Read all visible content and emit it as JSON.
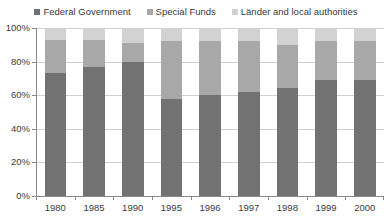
{
  "chart_data": {
    "type": "bar",
    "subtype": "stacked-100-percent",
    "title": "",
    "xlabel": "",
    "ylabel": "",
    "ylim": [
      0,
      100
    ],
    "ytick_labels": [
      "0%",
      "20%",
      "40%",
      "60%",
      "80%",
      "100%"
    ],
    "ytick_values": [
      0,
      20,
      40,
      60,
      80,
      100
    ],
    "grid": true,
    "legend_position": "top",
    "categories": [
      "1980",
      "1985",
      "1990",
      "1995",
      "1996",
      "1997",
      "1998",
      "1999",
      "2000"
    ],
    "series": [
      {
        "name": "Federal Government",
        "color": "#727272",
        "values": [
          73,
          77,
          80,
          58,
          60,
          62,
          64,
          69,
          69
        ]
      },
      {
        "name": "Special Funds",
        "color": "#a8a8a8",
        "values": [
          20,
          16,
          11,
          34,
          32,
          30,
          26,
          23,
          23
        ]
      },
      {
        "name": "Länder and local authorities",
        "color": "#d2d2d2",
        "values": [
          7,
          7,
          9,
          8,
          8,
          8,
          10,
          8,
          8
        ]
      }
    ]
  },
  "legend": {
    "items": [
      {
        "label": "Federal Government",
        "color": "#727272"
      },
      {
        "label": "Special Funds",
        "color": "#a8a8a8"
      },
      {
        "label": "Länder and local authorities",
        "color": "#d2d2d2"
      }
    ]
  },
  "axes": {
    "y": {
      "ticks": [
        {
          "label": "100%",
          "value": 100
        },
        {
          "label": "80%",
          "value": 80
        },
        {
          "label": "60%",
          "value": 60
        },
        {
          "label": "40%",
          "value": 40
        },
        {
          "label": "20%",
          "value": 20
        },
        {
          "label": "0%",
          "value": 0
        }
      ]
    },
    "x": {
      "ticks": [
        "1980",
        "1985",
        "1990",
        "1995",
        "1996",
        "1997",
        "1998",
        "1999",
        "2000"
      ]
    }
  },
  "colors": {
    "axis": "#8a8a8a",
    "grid": "#d0d0d0",
    "text": "#3a3a3a",
    "background": "#ffffff"
  }
}
